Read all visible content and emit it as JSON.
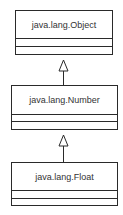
{
  "diagram": {
    "type": "uml-class-hierarchy",
    "classes": [
      {
        "name": "java.lang.Object"
      },
      {
        "name": "java.lang.Number"
      },
      {
        "name": "java.lang.Float"
      }
    ],
    "relations": [
      {
        "from": "java.lang.Number",
        "to": "java.lang.Object",
        "kind": "generalization"
      },
      {
        "from": "java.lang.Float",
        "to": "java.lang.Number",
        "kind": "generalization"
      }
    ],
    "colors": {
      "line": "#2a2a2a",
      "text": "#333333",
      "background": "#ffffff"
    }
  }
}
